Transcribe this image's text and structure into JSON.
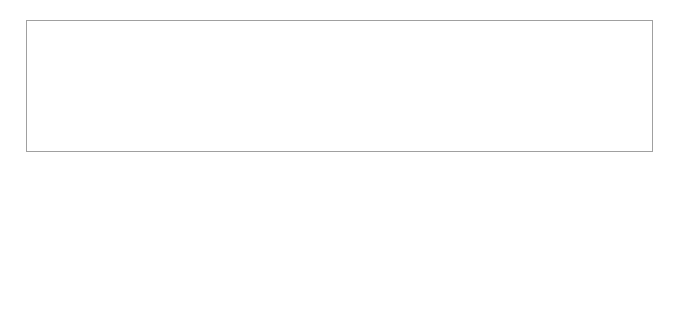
{
  "chart_data": {
    "type": "line",
    "title": "",
    "xlabel": "",
    "ylabel": "Mittelwerte",
    "categories": [
      "Verlust (N=38)",
      "Gewinn (N=53)"
    ],
    "series": [
      {
        "name": "Mittelwerte",
        "values": [
          5.13,
          4.3
        ],
        "marker": "diamond",
        "line_style": "dotted",
        "color": "#000000"
      }
    ],
    "ylim": [
      0,
      6
    ],
    "yticks": [
      "0",
      "1",
      "2",
      "3",
      "4",
      "5",
      "6"
    ],
    "grid": true,
    "legend": "none"
  }
}
